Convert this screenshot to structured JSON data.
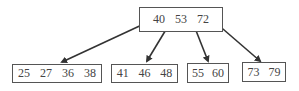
{
  "diagram": {
    "type": "b-tree",
    "root": {
      "keys": [
        "40",
        "53",
        "72"
      ]
    },
    "children": [
      {
        "keys": [
          "25",
          "27",
          "36",
          "38"
        ]
      },
      {
        "keys": [
          "41",
          "46",
          "48"
        ]
      },
      {
        "keys": [
          "55",
          "60"
        ]
      },
      {
        "keys": [
          "73",
          "79"
        ]
      }
    ],
    "colors": {
      "line": "#333333",
      "border": "#555555",
      "text": "#444444"
    }
  }
}
